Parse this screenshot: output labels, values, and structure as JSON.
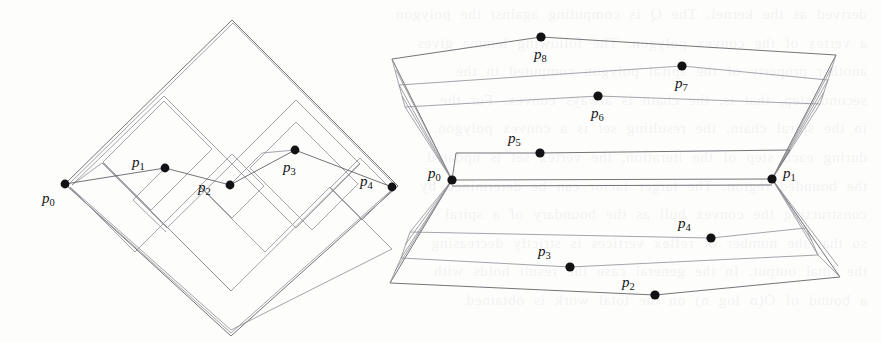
{
  "page": {
    "width": 881,
    "height": 343,
    "background_color": "#fdfdfc",
    "ink_color": "#5b5b61",
    "dot_color": "#121214"
  },
  "bleed_text": {
    "note": "Faint mirrored show-through of printed text from the reverse side of the scanned page",
    "lines": [
      "derived as the kernel. The Q is computing against the polygon",
      "a vertex of the convex polygon. The following lemma gives",
      "another property of the spiral polygon computed in the",
      "second step, that is, the chain is always convex. For the",
      "in the spiral chain, the resulting set is a convex polygon.",
      "during each step of the iteration, the vertex set is updated",
      "the bounded region. The larger factor can be determined by",
      "constructing the convex hull as the boundary of a spiral",
      "so that the number of reflex vertices is strictly decreasing",
      "the final output. In the general case the result holds with",
      "a bound of O(n log n) on the total work is obtained."
    ]
  },
  "figures": [
    {
      "id": "left-figure",
      "name": "nested-staircase-diamond",
      "description": "An orthogonal staircase chain inside a rotated square (diamond), with nested rectangular spiral corridors",
      "labeled_points": [
        {
          "label": "p",
          "sub": "0",
          "x": 65,
          "y": 184,
          "label_x": 42,
          "label_y": 203
        },
        {
          "label": "p",
          "sub": "1",
          "x": 165,
          "y": 168,
          "label_x": 132,
          "label_y": 167
        },
        {
          "label": "p",
          "sub": "2",
          "x": 230,
          "y": 185,
          "label_x": 198,
          "label_y": 192
        },
        {
          "label": "p",
          "sub": "3",
          "x": 295,
          "y": 150,
          "label_x": 283,
          "label_y": 172
        },
        {
          "label": "p",
          "sub": "4",
          "x": 392,
          "y": 187,
          "label_x": 360,
          "label_y": 186
        }
      ],
      "diamond_outer": [
        [
          65,
          184
        ],
        [
          232,
          20
        ],
        [
          398,
          186
        ],
        [
          231,
          336
        ]
      ],
      "staircase_chain": [
        [
          65,
          184
        ],
        [
          165,
          168
        ],
        [
          230,
          185
        ],
        [
          295,
          150
        ],
        [
          392,
          187
        ]
      ]
    },
    {
      "id": "right-figure",
      "name": "zigzag-fan-polygon",
      "description": "A zigzag (fan) polygon whose vertices alternate above and below the two hub vertices p0 and p1",
      "labeled_points": [
        {
          "label": "p",
          "sub": "0",
          "x": 452,
          "y": 180,
          "label_x": 428,
          "label_y": 178
        },
        {
          "label": "p",
          "sub": "1",
          "x": 772,
          "y": 179,
          "label_x": 783,
          "label_y": 178
        },
        {
          "label": "p",
          "sub": "2",
          "x": 655,
          "y": 295,
          "label_x": 622,
          "label_y": 287
        },
        {
          "label": "p",
          "sub": "3",
          "x": 570,
          "y": 267,
          "label_x": 538,
          "label_y": 256
        },
        {
          "label": "p",
          "sub": "4",
          "x": 711,
          "y": 238,
          "label_x": 678,
          "label_y": 228
        },
        {
          "label": "p",
          "sub": "5",
          "x": 540,
          "y": 153,
          "label_x": 508,
          "label_y": 143
        },
        {
          "label": "p",
          "sub": "6",
          "x": 598,
          "y": 96,
          "label_x": 591,
          "label_y": 118
        },
        {
          "label": "p",
          "sub": "7",
          "x": 682,
          "y": 66,
          "label_x": 675,
          "label_y": 88
        },
        {
          "label": "p",
          "sub": "8",
          "x": 541,
          "y": 37,
          "label_x": 534,
          "label_y": 59
        }
      ],
      "hub_left": [
        452,
        180
      ],
      "hub_right": [
        772,
        179
      ]
    }
  ]
}
